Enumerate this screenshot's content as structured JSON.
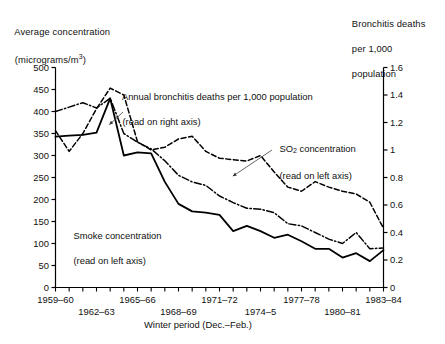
{
  "figure": {
    "left_axis_title_line1": "Average concentration",
    "left_axis_title_line2_prefix": "(micrograms/m",
    "left_axis_title_line2_sup": "3",
    "left_axis_title_line2_suffix": ")",
    "right_axis_title_line1": "Bronchitis deaths",
    "right_axis_title_line2": "per 1,000",
    "right_axis_title_line3": "population",
    "xaxis_title": "Winter period (Dec.–Feb.)"
  },
  "annotations": {
    "bronchitis_line1": "Annual bronchitis deaths per 1,000 population",
    "bronchitis_line2": "(read on right axis)",
    "so2_line1_prefix": "SO",
    "so2_line1_sub": "2",
    "so2_line1_suffix": " concentration",
    "so2_line2": "(read on left axis)",
    "smoke_line1": "Smoke concentration",
    "smoke_line2": "(read on left axis)"
  },
  "chart_data": {
    "type": "line",
    "title": "",
    "xlabel": "Winter period (Dec.–Feb.)",
    "ylabel": "Average concentration (micrograms/m3)",
    "y2label": "Bronchitis deaths per 1,000 population",
    "grid": false,
    "legend": "inline-annotations",
    "ylim": [
      0,
      500
    ],
    "y2lim": [
      0,
      1.6
    ],
    "yticks": [
      0,
      50,
      100,
      150,
      200,
      250,
      300,
      350,
      400,
      450,
      500
    ],
    "y2ticks": [
      0,
      0.2,
      0.4,
      0.6,
      0.8,
      1,
      1.2,
      1.4,
      1.6
    ],
    "ytick_labels": [
      "0",
      "50",
      "100",
      "150",
      "200",
      "250",
      "300",
      "350",
      "400",
      "450",
      "500"
    ],
    "y2tick_labels": [
      "0",
      "0.2",
      "0.4",
      "0.6",
      "0.8",
      "1",
      "1.2",
      "1.4",
      "1.6"
    ],
    "x": [
      "1959–60",
      "1960–61",
      "1961–62",
      "1962–63",
      "1963–64",
      "1964–65",
      "1965–66",
      "1966–67",
      "1967–68",
      "1968–69",
      "1969–70",
      "1970–71",
      "1971–72",
      "1972–73",
      "1973–74",
      "1974–5",
      "1975–76",
      "1976–77",
      "1977–78",
      "1978–79",
      "1979–80",
      "1980–81",
      "1981–82",
      "1982–83",
      "1983–84"
    ],
    "xtick_labels_shown": [
      {
        "x": "1959–60",
        "index": 0,
        "row": 0
      },
      {
        "x": "1962–63",
        "index": 3,
        "row": 1
      },
      {
        "x": "1965–66",
        "index": 6,
        "row": 0
      },
      {
        "x": "1968–69",
        "index": 9,
        "row": 1
      },
      {
        "x": "1971–72",
        "index": 12,
        "row": 0
      },
      {
        "x": "1974–5",
        "index": 15,
        "row": 1
      },
      {
        "x": "1977–78",
        "index": 18,
        "row": 0
      },
      {
        "x": "1980–81",
        "index": 21,
        "row": 1
      },
      {
        "x": "1983–84",
        "index": 24,
        "row": 0
      }
    ],
    "series": [
      {
        "name": "Smoke concentration",
        "axis": "left",
        "style": "solid",
        "color": "#000000",
        "unit": "micrograms/m3",
        "values": [
          343,
          345,
          347,
          352,
          430,
          300,
          307,
          305,
          240,
          190,
          173,
          170,
          165,
          128,
          140,
          128,
          113,
          120,
          105,
          88,
          88,
          68,
          78,
          60,
          85
        ]
      },
      {
        "name": "SO2 concentration",
        "axis": "left",
        "style": "dash-dot",
        "color": "#000000",
        "unit": "micrograms/m3",
        "values": [
          400,
          410,
          420,
          408,
          430,
          350,
          330,
          315,
          288,
          255,
          240,
          232,
          208,
          193,
          180,
          178,
          170,
          145,
          140,
          125,
          110,
          100,
          125,
          88,
          90
        ]
      },
      {
        "name": "Annual bronchitis deaths per 1,000 population",
        "axis": "right",
        "style": "dashed",
        "color": "#000000",
        "unit": "deaths per 1,000",
        "values": [
          1.14,
          0.99,
          1.12,
          1.3,
          1.45,
          1.4,
          1.06,
          1.0,
          1.02,
          1.08,
          1.1,
          0.99,
          0.94,
          0.93,
          0.92,
          0.96,
          0.84,
          0.73,
          0.7,
          0.77,
          0.73,
          0.7,
          0.68,
          0.62,
          0.43
        ]
      }
    ]
  }
}
